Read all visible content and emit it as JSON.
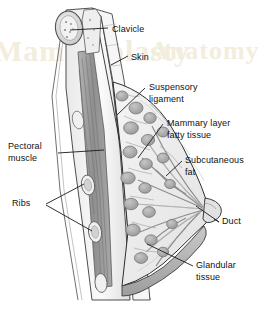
{
  "figure": {
    "type": "anatomical-cross-section",
    "background_color": "#ffffff",
    "line_color": "#1a1a1a",
    "watermark_color": "#f3eddd"
  },
  "watermark": {
    "line1": "Mammoplasty",
    "line2": "Anatomy"
  },
  "labels": [
    {
      "id": "clavicle",
      "text": "Clavicle",
      "lines": [
        "Clavicle"
      ],
      "x": 112,
      "y": 24,
      "align": "left"
    },
    {
      "id": "skin",
      "text": "Skin",
      "lines": [
        "Skin"
      ],
      "x": 131,
      "y": 52,
      "align": "left"
    },
    {
      "id": "suspensory-ligament",
      "text": "Suspensory ligament",
      "lines": [
        "Suspensory",
        "ligament"
      ],
      "x": 149,
      "y": 82,
      "align": "left"
    },
    {
      "id": "mammary-fatty-tissue",
      "text": "Mammary layer fatty tissue",
      "lines": [
        "Mammary layer",
        "fatty tissue"
      ],
      "x": 167,
      "y": 118,
      "align": "left"
    },
    {
      "id": "subcutaneous-fat",
      "text": "Subcutaneous fat",
      "lines": [
        "Subcutaneous",
        "fat"
      ],
      "x": 185,
      "y": 155,
      "align": "left"
    },
    {
      "id": "pectoral-muscle",
      "text": "Pectoral muscle",
      "lines": [
        "Pectoral",
        "muscle"
      ],
      "x": 8,
      "y": 141,
      "align": "left"
    },
    {
      "id": "ribs",
      "text": "Ribs",
      "lines": [
        "Ribs"
      ],
      "x": 12,
      "y": 198,
      "align": "left"
    },
    {
      "id": "duct",
      "text": "Duct",
      "lines": [
        "Duct"
      ],
      "x": 222,
      "y": 216,
      "align": "left"
    },
    {
      "id": "glandular-tissue",
      "text": "Glandular tissue",
      "lines": [
        "Glandular",
        "tissue"
      ],
      "x": 196,
      "y": 260,
      "align": "left"
    }
  ],
  "structures": [
    {
      "id": "clavicle-bone",
      "name": "clavicle bone cross-section"
    },
    {
      "id": "skin-layer",
      "name": "skin layer"
    },
    {
      "id": "pectoralis",
      "name": "pectoralis major muscle"
    },
    {
      "id": "rib-1",
      "name": "rib cross-section upper"
    },
    {
      "id": "rib-2",
      "name": "rib cross-section lower"
    },
    {
      "id": "lobules",
      "name": "glandular lobules"
    },
    {
      "id": "lactiferous-ducts",
      "name": "lactiferous ducts"
    },
    {
      "id": "nipple",
      "name": "nipple"
    },
    {
      "id": "inframammary-fold",
      "name": "inframammary fold"
    },
    {
      "id": "cooper-ligaments",
      "name": "suspensory (Cooper's) ligaments"
    }
  ]
}
